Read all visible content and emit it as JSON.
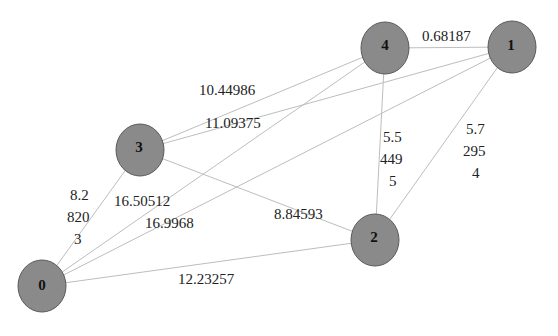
{
  "graph": {
    "nodes": [
      {
        "id": "0",
        "label": "0",
        "x": 42,
        "y": 286
      },
      {
        "id": "1",
        "label": "1",
        "x": 512,
        "y": 47
      },
      {
        "id": "2",
        "label": "2",
        "x": 375,
        "y": 240
      },
      {
        "id": "3",
        "label": "3",
        "x": 140,
        "y": 150
      },
      {
        "id": "4",
        "label": "4",
        "x": 385,
        "y": 48
      }
    ],
    "edges": [
      {
        "from": "4",
        "to": "1",
        "weight": "0.68187"
      },
      {
        "from": "3",
        "to": "4",
        "weight": "10.44986"
      },
      {
        "from": "3",
        "to": "1",
        "weight": "11.09375"
      },
      {
        "from": "0",
        "to": "3",
        "weight": "8.2\n820\n3"
      },
      {
        "from": "0",
        "to": "4",
        "weight": "16.50512"
      },
      {
        "from": "0",
        "to": "1",
        "weight": "16.9968"
      },
      {
        "from": "3",
        "to": "2",
        "weight": "8.84593"
      },
      {
        "from": "0",
        "to": "2",
        "weight": "12.23257"
      },
      {
        "from": "4",
        "to": "2",
        "weight": "5.5\n449\n5"
      },
      {
        "from": "1",
        "to": "2",
        "weight": "5.7\n295\n4"
      }
    ],
    "labels": {
      "e41": "0.68187",
      "e34": "10.44986",
      "e31": "11.09375",
      "e03": [
        "8.2",
        "820",
        "3"
      ],
      "e04": "16.50512",
      "e01": "16.9968",
      "e32": "8.84593",
      "e02": "12.23257",
      "e42": [
        "5.5",
        "449",
        "5"
      ],
      "e12": [
        "5.7",
        "295",
        "4"
      ]
    },
    "node_color": "#8a8a8a",
    "edge_color": "#bdbdbd"
  }
}
